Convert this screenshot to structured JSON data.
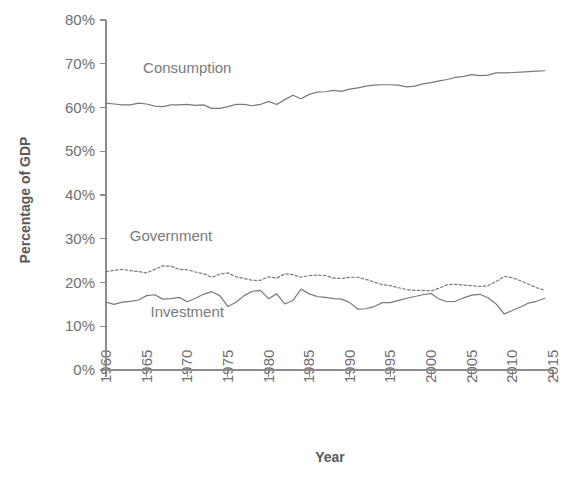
{
  "chart_data": {
    "type": "line",
    "title": "",
    "xlabel": "Year",
    "ylabel": "Percentage of GDP",
    "xlim": [
      1960,
      2015
    ],
    "ylim": [
      0,
      80
    ],
    "grid": false,
    "legend_position": "inline-annotations",
    "x_tick_labels": [
      "1960",
      "1965",
      "1970",
      "1975",
      "1980",
      "1985",
      "1990",
      "1995",
      "2000",
      "2005",
      "2010",
      "2015"
    ],
    "y_tick_labels": [
      "0%",
      "10%",
      "20%",
      "30%",
      "40%",
      "50%",
      "60%",
      "70%",
      "80%"
    ],
    "x": [
      1960,
      1961,
      1962,
      1963,
      1964,
      1965,
      1966,
      1967,
      1968,
      1969,
      1970,
      1971,
      1972,
      1973,
      1974,
      1975,
      1976,
      1977,
      1978,
      1979,
      1980,
      1981,
      1982,
      1983,
      1984,
      1985,
      1986,
      1987,
      1988,
      1989,
      1990,
      1991,
      1992,
      1993,
      1994,
      1995,
      1996,
      1997,
      1998,
      1999,
      2000,
      2001,
      2002,
      2003,
      2004,
      2005,
      2006,
      2007,
      2008,
      2009,
      2010,
      2011,
      2012,
      2013,
      2014
    ],
    "series": [
      {
        "name": "Consumption",
        "style": "solid",
        "color": "#7a7a7a",
        "label_x": 1970,
        "label_y": 68,
        "values": [
          61.0,
          60.8,
          60.6,
          60.6,
          61.0,
          60.8,
          60.3,
          60.2,
          60.6,
          60.6,
          60.7,
          60.5,
          60.6,
          59.8,
          59.8,
          60.2,
          60.7,
          60.7,
          60.4,
          60.7,
          61.4,
          60.7,
          61.8,
          62.8,
          62.0,
          63.0,
          63.5,
          63.6,
          63.9,
          63.7,
          64.2,
          64.5,
          64.9,
          65.1,
          65.2,
          65.2,
          65.1,
          64.7,
          64.9,
          65.4,
          65.7,
          66.1,
          66.4,
          66.9,
          67.1,
          67.5,
          67.3,
          67.4,
          67.9,
          67.9,
          68.0,
          68.1,
          68.2,
          68.3,
          68.4
        ]
      },
      {
        "name": "Government",
        "style": "dotted",
        "color": "#7a7a7a",
        "label_x": 1968,
        "label_y": 29.5,
        "values": [
          22.5,
          22.8,
          23.0,
          22.7,
          22.5,
          22.2,
          23.0,
          23.8,
          23.7,
          23.0,
          22.9,
          22.4,
          22.0,
          21.2,
          21.9,
          22.2,
          21.3,
          20.9,
          20.5,
          20.5,
          21.3,
          21.0,
          22.0,
          21.8,
          21.2,
          21.6,
          21.7,
          21.6,
          21.0,
          20.9,
          21.2,
          21.2,
          20.7,
          20.1,
          19.5,
          19.3,
          18.8,
          18.4,
          18.2,
          18.2,
          18.1,
          18.7,
          19.5,
          19.6,
          19.4,
          19.3,
          19.1,
          19.3,
          20.2,
          21.4,
          21.1,
          20.4,
          19.6,
          18.8,
          18.2
        ]
      },
      {
        "name": "Investment",
        "style": "solid",
        "color": "#7a7a7a",
        "label_x": 1970,
        "label_y": 12.2,
        "values": [
          15.5,
          15.0,
          15.5,
          15.7,
          16.0,
          17.0,
          17.2,
          16.2,
          16.3,
          16.6,
          15.6,
          16.4,
          17.3,
          17.9,
          17.0,
          14.5,
          15.5,
          17.0,
          18.0,
          18.2,
          16.3,
          17.4,
          15.1,
          15.9,
          18.5,
          17.4,
          16.8,
          16.6,
          16.3,
          16.2,
          15.4,
          13.9,
          14.0,
          14.5,
          15.4,
          15.4,
          15.9,
          16.4,
          16.8,
          17.2,
          17.5,
          16.2,
          15.6,
          15.7,
          16.5,
          17.1,
          17.3,
          16.5,
          15.1,
          12.8,
          13.6,
          14.4,
          15.3,
          15.7,
          16.4
        ]
      }
    ]
  }
}
